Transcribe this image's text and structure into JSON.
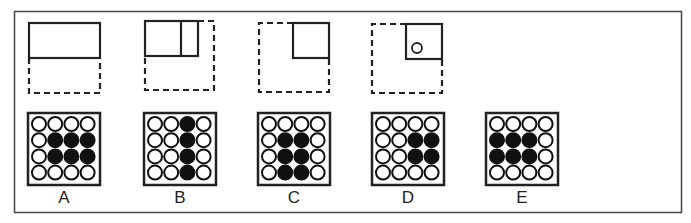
{
  "puzzle": {
    "colors": {
      "stroke": "#222222",
      "frame": "#444444",
      "fill": "#111111",
      "background": "#ffffff"
    },
    "folding_steps": [
      {
        "id": "step1",
        "description": "square folded in half: top half solid, bottom half dashed"
      },
      {
        "id": "step2",
        "description": "folded again to quarter with a solid vertical fold line"
      },
      {
        "id": "step3",
        "description": "solid top-right quarter square within dashed outline"
      },
      {
        "id": "step4",
        "description": "top-right quarter with a punched hole (circle)",
        "hole": true
      }
    ],
    "options": [
      {
        "label": "A",
        "grid": [
          [
            0,
            0,
            0,
            0
          ],
          [
            0,
            1,
            1,
            1
          ],
          [
            0,
            1,
            1,
            1
          ],
          [
            0,
            0,
            0,
            0
          ]
        ]
      },
      {
        "label": "B",
        "grid": [
          [
            0,
            0,
            1,
            0
          ],
          [
            0,
            0,
            1,
            0
          ],
          [
            0,
            0,
            1,
            0
          ],
          [
            0,
            0,
            1,
            0
          ]
        ]
      },
      {
        "label": "C",
        "grid": [
          [
            0,
            0,
            0,
            0
          ],
          [
            0,
            1,
            1,
            0
          ],
          [
            0,
            1,
            1,
            0
          ],
          [
            0,
            1,
            1,
            0
          ]
        ]
      },
      {
        "label": "D",
        "grid": [
          [
            0,
            0,
            0,
            0
          ],
          [
            0,
            0,
            1,
            1
          ],
          [
            0,
            0,
            1,
            1
          ],
          [
            0,
            0,
            0,
            0
          ]
        ]
      },
      {
        "label": "E",
        "grid": [
          [
            0,
            0,
            0,
            0
          ],
          [
            1,
            1,
            1,
            0
          ],
          [
            1,
            1,
            1,
            0
          ],
          [
            0,
            0,
            0,
            0
          ]
        ]
      }
    ]
  }
}
